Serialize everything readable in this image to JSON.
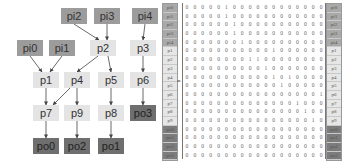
{
  "graph": {
    "nodes": [
      {
        "id": "pi0",
        "type": "in",
        "x": 17,
        "y": 40
      },
      {
        "id": "pi1",
        "type": "in",
        "x": 49,
        "y": 40
      },
      {
        "id": "pi2",
        "type": "in",
        "x": 61,
        "y": 8
      },
      {
        "id": "pi3",
        "type": "in",
        "x": 94,
        "y": 8
      },
      {
        "id": "pi4",
        "type": "in",
        "x": 132,
        "y": 8
      },
      {
        "id": "p1",
        "type": "mid",
        "x": 33,
        "y": 72
      },
      {
        "id": "p2",
        "type": "mid",
        "x": 90,
        "y": 40
      },
      {
        "id": "p3",
        "type": "mid",
        "x": 130,
        "y": 40
      },
      {
        "id": "p4",
        "type": "mid",
        "x": 64,
        "y": 72
      },
      {
        "id": "p5",
        "type": "mid",
        "x": 98,
        "y": 72
      },
      {
        "id": "p6",
        "type": "mid",
        "x": 130,
        "y": 72
      },
      {
        "id": "p7",
        "type": "mid",
        "x": 33,
        "y": 105
      },
      {
        "id": "p8",
        "type": "mid",
        "x": 98,
        "y": 105
      },
      {
        "id": "p9",
        "type": "mid",
        "x": 64,
        "y": 105
      },
      {
        "id": "po0",
        "type": "out",
        "x": 33,
        "y": 138
      },
      {
        "id": "po1",
        "type": "out",
        "x": 98,
        "y": 138
      },
      {
        "id": "po2",
        "type": "out",
        "x": 64,
        "y": 138
      },
      {
        "id": "po3",
        "type": "out",
        "x": 130,
        "y": 105
      }
    ],
    "edges": [
      [
        "pi0",
        "p1"
      ],
      [
        "pi1",
        "p1"
      ],
      [
        "pi2",
        "p2"
      ],
      [
        "pi3",
        "p2"
      ],
      [
        "pi4",
        "p3"
      ],
      [
        "p1",
        "p7"
      ],
      [
        "p2",
        "p4"
      ],
      [
        "p2",
        "p5"
      ],
      [
        "p3",
        "p6"
      ],
      [
        "p4",
        "p7"
      ],
      [
        "p4",
        "p9"
      ],
      [
        "p5",
        "p8"
      ],
      [
        "p6",
        "po3"
      ],
      [
        "p7",
        "po0"
      ],
      [
        "p8",
        "po1"
      ],
      [
        "p9",
        "po2"
      ]
    ],
    "colors": {
      "in": "#9c9c9c",
      "mid": "#e4e4e4",
      "out": "#6f6f6f",
      "edge": "#444444"
    }
  },
  "matrix": {
    "equals_sign": "=",
    "labels": [
      "pi0",
      "pi1",
      "pi2",
      "pi3",
      "pi4",
      "p1",
      "p2",
      "p3",
      "p4",
      "p5",
      "p6",
      "p7",
      "p8",
      "p9",
      "po0",
      "po1",
      "po2",
      "po3"
    ],
    "label_types": [
      "in",
      "in",
      "in",
      "in",
      "in",
      "mid",
      "mid",
      "mid",
      "mid",
      "mid",
      "mid",
      "mid",
      "mid",
      "mid",
      "out",
      "out",
      "out",
      "out"
    ],
    "rows": [
      [
        "0",
        "0",
        "0",
        "0",
        "0",
        "1",
        "0",
        "0",
        "0",
        "0",
        "0",
        "0",
        "0",
        "0",
        "0",
        "0",
        "0",
        "0"
      ],
      [
        "0",
        "0",
        "0",
        "0",
        "0",
        "1",
        "0",
        "0",
        "0",
        "0",
        "0",
        "0",
        "0",
        "0",
        "0",
        "0",
        "0",
        "0"
      ],
      [
        "0",
        "0",
        "0",
        "0",
        "0",
        "0",
        "1",
        "0",
        "0",
        "0",
        "0",
        "0",
        "0",
        "0",
        "0",
        "0",
        "0",
        "0"
      ],
      [
        "0",
        "0",
        "0",
        "0",
        "0",
        "0",
        "1",
        "0",
        "0",
        "0",
        "0",
        "0",
        "0",
        "0",
        "0",
        "0",
        "0",
        "0"
      ],
      [
        "0",
        "0",
        "0",
        "0",
        "0",
        "0",
        "0",
        "1",
        "0",
        "0",
        "0",
        "0",
        "0",
        "0",
        "0",
        "0",
        "0",
        "0"
      ],
      [
        "0",
        "0",
        "0",
        "0",
        "0",
        "0",
        "0",
        "0",
        "0",
        "0",
        "0",
        "1",
        "0",
        "0",
        "0",
        "0",
        "0",
        "0"
      ],
      [
        "0",
        "0",
        "0",
        "0",
        "0",
        "0",
        "0",
        "0",
        "1",
        "1",
        "0",
        "0",
        "0",
        "0",
        "0",
        "0",
        "0",
        "0"
      ],
      [
        "0",
        "0",
        "0",
        "0",
        "0",
        "0",
        "0",
        "0",
        "0",
        "0",
        "1",
        "0",
        "0",
        "0",
        "0",
        "0",
        "0",
        "0"
      ],
      [
        "0",
        "0",
        "0",
        "0",
        "0",
        "0",
        "0",
        "0",
        "0",
        "0",
        "0",
        "1",
        "0",
        "1",
        "0",
        "0",
        "0",
        "0"
      ],
      [
        "0",
        "0",
        "0",
        "0",
        "0",
        "0",
        "0",
        "0",
        "0",
        "0",
        "0",
        "0",
        "1",
        "0",
        "0",
        "0",
        "0",
        "0"
      ],
      [
        "0",
        "0",
        "0",
        "0",
        "0",
        "0",
        "0",
        "0",
        "0",
        "0",
        "0",
        "0",
        "0",
        "0",
        "0",
        "0",
        "0",
        "1"
      ],
      [
        "0",
        "0",
        "0",
        "0",
        "0",
        "0",
        "0",
        "0",
        "0",
        "0",
        "0",
        "0",
        "0",
        "0",
        "1",
        "0",
        "0",
        "0"
      ],
      [
        "0",
        "0",
        "0",
        "0",
        "0",
        "0",
        "0",
        "0",
        "0",
        "0",
        "0",
        "0",
        "0",
        "0",
        "0",
        "1",
        "0",
        "0"
      ],
      [
        "0",
        "0",
        "0",
        "0",
        "0",
        "0",
        "0",
        "0",
        "0",
        "0",
        "0",
        "0",
        "0",
        "0",
        "0",
        "0",
        "1",
        "0"
      ],
      [
        "0",
        "0",
        "0",
        "0",
        "0",
        "0",
        "0",
        "0",
        "0",
        "0",
        "0",
        "0",
        "0",
        "0",
        "0",
        "0",
        "0",
        "0"
      ],
      [
        "0",
        "0",
        "0",
        "0",
        "0",
        "0",
        "0",
        "0",
        "0",
        "0",
        "0",
        "0",
        "0",
        "0",
        "0",
        "0",
        "0",
        "0"
      ],
      [
        "0",
        "0",
        "0",
        "0",
        "0",
        "0",
        "0",
        "0",
        "0",
        "0",
        "0",
        "0",
        "0",
        "0",
        "0",
        "0",
        "0",
        "0"
      ],
      [
        "0",
        "0",
        "0",
        "0",
        "0",
        "0",
        "0",
        "0",
        "0",
        "0",
        "0",
        "0",
        "0",
        "0",
        "0",
        "0",
        "0",
        "0"
      ]
    ]
  }
}
